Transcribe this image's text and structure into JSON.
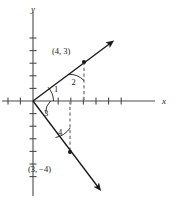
{
  "figure": {
    "axes": {
      "x_label": "x",
      "y_label": "y",
      "origin_px": [
        33,
        101
      ],
      "unit_px": 12.6,
      "x_range": [
        -2.6,
        10.6
      ],
      "y_range": [
        -7.6,
        7.6
      ],
      "x_tick_count_negative": 2,
      "x_tick_count_positive": 8,
      "y_tick_count_positive": 5,
      "y_tick_count_negative": 6,
      "grid": false
    },
    "points": [
      {
        "name": "point-4-3",
        "label": "(4, 3)",
        "x": 4,
        "y": 3,
        "label_dx": -30,
        "label_dy": -8
      },
      {
        "name": "point-3-minus4",
        "label": "(3, −4)",
        "x": 3,
        "y": -4,
        "label_dx": -42,
        "label_dy": 16
      }
    ],
    "angles": [
      {
        "name": "angle-1",
        "label": "1",
        "lx": 54,
        "ly": 89
      },
      {
        "name": "angle-2",
        "label": "2",
        "lx": 71,
        "ly": 81
      },
      {
        "name": "angle-3",
        "label": "3",
        "lx": 49,
        "ly": 114
      },
      {
        "name": "angle-4",
        "label": "4",
        "lx": 61,
        "ly": 134
      }
    ],
    "rays": [
      {
        "name": "ray-upper-right",
        "from": [
          33,
          101
        ],
        "to": [
          112,
          42
        ],
        "arrow": true
      },
      {
        "name": "ray-lower-right",
        "from": [
          33,
          101
        ],
        "to": [
          100,
          190
        ],
        "arrow": true
      }
    ],
    "dashed_segments": [
      {
        "name": "dashed-drop-from-4-3",
        "x": 84,
        "y1": 62,
        "y2": 101
      },
      {
        "name": "dashed-drop-to-3-minus4",
        "x": 70,
        "y1": 101,
        "y2": 152
      }
    ],
    "colors": {
      "stroke": "#1a1a1a",
      "dashed": "#8f8f8f",
      "background": "#ffffff"
    }
  }
}
